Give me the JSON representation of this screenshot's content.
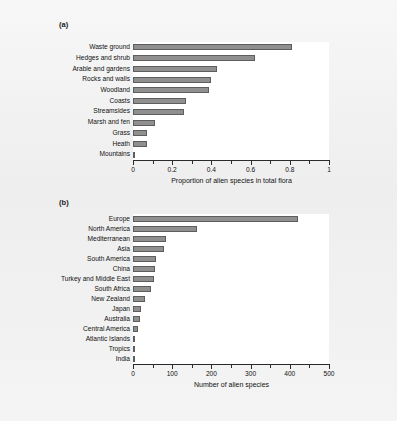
{
  "figure": {
    "background_color": "#f2f2f2",
    "bar_fill_color": "#8f8f8f",
    "bar_edge_color": "#5d5d5d",
    "axis_color": "#2b2b2b",
    "plot_background_color": "#ffffff"
  },
  "panels": [
    {
      "tag": "(a)"
    },
    {
      "tag": "(b)"
    }
  ],
  "chart_data": [
    {
      "type": "bar",
      "orientation": "horizontal",
      "panel": "(a)",
      "title": "",
      "xlabel": "Proportion of alien species in total flora",
      "ylabel": "",
      "xlim": [
        0,
        1
      ],
      "xticks": [
        0,
        0.2,
        0.4,
        0.6,
        0.8,
        1
      ],
      "xtick_labels": [
        "0",
        "0.2",
        "0.4",
        "0.6",
        "0.8",
        "1"
      ],
      "minor_ticks": true,
      "grid": false,
      "legend": null,
      "categories": [
        "Waste ground",
        "Hedges and shrub",
        "Arable and gardens",
        "Rocks and walls",
        "Woodland",
        "Coasts",
        "Streamsides",
        "Marsh and fen",
        "Grass",
        "Heath",
        "Mountains"
      ],
      "values": [
        0.81,
        0.62,
        0.43,
        0.4,
        0.39,
        0.27,
        0.26,
        0.11,
        0.07,
        0.07,
        0.005
      ]
    },
    {
      "type": "bar",
      "orientation": "horizontal",
      "panel": "(b)",
      "title": "",
      "xlabel": "Number of alien species",
      "ylabel": "",
      "xlim": [
        0,
        500
      ],
      "xticks": [
        0,
        100,
        200,
        300,
        400,
        500
      ],
      "xtick_labels": [
        "0",
        "100",
        "200",
        "300",
        "400",
        "500"
      ],
      "minor_ticks": true,
      "grid": false,
      "legend": null,
      "categories": [
        "Europe",
        "North America",
        "Mediterranean",
        "Asia",
        "South America",
        "China",
        "Turkey and Middle East",
        "South Africa",
        "New Zealand",
        "Japan",
        "Australia",
        "Central America",
        "Atlantic Islands",
        "Tropics",
        "India"
      ],
      "values": [
        420,
        163,
        85,
        78,
        58,
        55,
        54,
        45,
        31,
        21,
        17,
        13,
        5,
        3,
        2
      ]
    }
  ]
}
